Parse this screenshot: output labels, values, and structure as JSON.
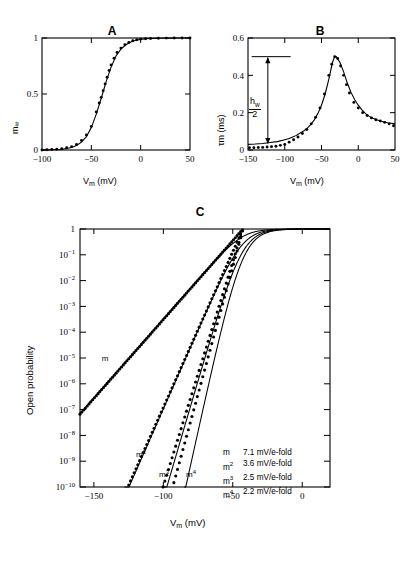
{
  "figure": {
    "panels": [
      {
        "id": "A",
        "letter": "A",
        "xlabel": "V",
        "xlabel_sub": "m",
        "xlabel_unit": " (mV)",
        "ylabel": "m",
        "ylabel_sub": "∞",
        "xticks": [
          -100,
          -50,
          0,
          50
        ],
        "xticklabels": [
          "−100",
          "−50",
          "0",
          "50"
        ],
        "yticks": [
          0,
          0.5,
          1
        ],
        "yticklabels": [
          "0",
          "0.5",
          "1"
        ],
        "xlim": [
          -100,
          50
        ],
        "ylim": [
          0,
          1
        ]
      },
      {
        "id": "B",
        "letter": "B",
        "xlabel": "V",
        "xlabel_sub": "m",
        "xlabel_unit": " (mV)",
        "ylabel": "τ",
        "ylabel_sub": "m",
        "ylabel_unit": " (ms)",
        "xticks": [
          -150,
          -100,
          -50,
          0,
          50
        ],
        "xticklabels": [
          "−150",
          "−100",
          "−50",
          "0",
          "50"
        ],
        "yticks": [
          0,
          0.2,
          0.4,
          0.6
        ],
        "yticklabels": [
          "0",
          "0.2",
          "0.4",
          "0.6"
        ],
        "xlim": [
          -150,
          50
        ],
        "ylim": [
          0,
          0.6
        ],
        "annotation": {
          "numerator": "h",
          "numerator_sub": "w",
          "denominator": "2",
          "arrow_top_value": 0.5,
          "arrow_bottom_value": 0.03
        }
      },
      {
        "id": "C",
        "letter": "C",
        "xlabel": "V",
        "xlabel_sub": "m",
        "xlabel_unit": " (mV)",
        "ylabel": "Open probability",
        "xticks": [
          -150,
          -100,
          -50,
          0
        ],
        "xticklabels": [
          "−150",
          "−100",
          "−50",
          "0"
        ],
        "yticklabels": [
          "1",
          "10⁻¹",
          "10⁻²",
          "10⁻³",
          "10⁻⁴",
          "10⁻⁵",
          "10⁻⁶",
          "10⁻⁷",
          "10⁻⁸",
          "10⁻⁹",
          "10⁻¹⁰"
        ],
        "yexponents": [
          0,
          -1,
          -2,
          -3,
          -4,
          -5,
          -6,
          -7,
          -8,
          -9,
          -10
        ],
        "xlim": [
          -160,
          20
        ],
        "ylim_exp": [
          -10,
          0
        ],
        "curve_tags": [
          "m",
          "m²",
          "m³",
          "m⁴"
        ],
        "legend": {
          "rows": [
            {
              "symbol": "m",
              "exponent": "",
              "value": "7.1 mV/e-fold"
            },
            {
              "symbol": "m",
              "exponent": "2",
              "value": "3.6 mV/e-fold"
            },
            {
              "symbol": "m",
              "exponent": "3",
              "value": "2.5 mV/e-fold"
            },
            {
              "symbol": "m",
              "exponent": "4",
              "value": "2.2 mV/e-fold"
            }
          ]
        }
      }
    ],
    "colors": {
      "ink": "#000000",
      "background": "#ffffff"
    }
  },
  "chart_data": [
    {
      "type": "line",
      "id": "A",
      "title": "A",
      "xlabel": "Vm (mV)",
      "ylabel": "m∞",
      "xlim": [
        -100,
        50
      ],
      "ylim": [
        0,
        1
      ],
      "grid": false,
      "legend": "none",
      "description": "Steady-state activation m-infinity versus membrane potential; sigmoid with half-activation near -38 mV; solid line is fit, filled circles are data.",
      "series": [
        {
          "name": "m_inf fit (solid line)",
          "style": "solid",
          "x": [
            -100,
            -95,
            -90,
            -85,
            -80,
            -75,
            -70,
            -65,
            -60,
            -55,
            -50,
            -45,
            -40,
            -35,
            -30,
            -25,
            -20,
            -15,
            -10,
            -5,
            0,
            5,
            10,
            15,
            20,
            25,
            30,
            35,
            40,
            45,
            50
          ],
          "y": [
            0.0,
            0.001,
            0.002,
            0.004,
            0.007,
            0.013,
            0.023,
            0.04,
            0.07,
            0.12,
            0.2,
            0.32,
            0.46,
            0.61,
            0.74,
            0.84,
            0.9,
            0.94,
            0.965,
            0.98,
            0.988,
            0.993,
            0.996,
            0.997,
            0.998,
            0.999,
            0.999,
            1.0,
            1.0,
            1.0,
            1.0
          ]
        },
        {
          "name": "data (filled circles)",
          "style": "dots",
          "x": [
            -100,
            -95,
            -90,
            -85,
            -80,
            -75,
            -70,
            -65,
            -60,
            -55,
            -50,
            -45,
            -42,
            -40,
            -38,
            -36,
            -34,
            -32,
            -30,
            -27,
            -24,
            -20,
            -16,
            -12,
            -8,
            -4,
            0,
            5,
            10,
            18,
            26,
            34,
            42,
            50
          ],
          "y": [
            0.0,
            0.002,
            0.004,
            0.007,
            0.012,
            0.02,
            0.03,
            0.05,
            0.085,
            0.135,
            0.21,
            0.34,
            0.42,
            0.47,
            0.53,
            0.59,
            0.65,
            0.71,
            0.76,
            0.82,
            0.87,
            0.91,
            0.94,
            0.96,
            0.975,
            0.985,
            0.99,
            0.993,
            0.996,
            0.998,
            0.999,
            1.0,
            1.0,
            1.0
          ]
        }
      ]
    },
    {
      "type": "line",
      "id": "B",
      "title": "B",
      "xlabel": "Vm (mV)",
      "ylabel": "τm (ms)",
      "xlim": [
        -150,
        50
      ],
      "ylim": [
        0,
        0.6
      ],
      "grid": false,
      "legend": "none",
      "annotation": "h_w/2 double-headed arrow from ~0.03 to 0.50 ms at x ≈ -123 mV; horizontal reference line at 0.50 ms from -143 to -92 mV",
      "description": "Activation time constant tau_m versus membrane potential; bell-shaped peak of 0.50 ms near -32 mV.",
      "series": [
        {
          "name": "tau_m fit (solid line)",
          "style": "solid",
          "x": [
            -150,
            -140,
            -130,
            -120,
            -110,
            -100,
            -95,
            -90,
            -85,
            -80,
            -75,
            -70,
            -65,
            -60,
            -55,
            -50,
            -45,
            -40,
            -35,
            -32,
            -30,
            -25,
            -20,
            -15,
            -10,
            -5,
            0,
            5,
            10,
            15,
            20,
            25,
            30,
            35,
            40,
            45,
            50
          ],
          "y": [
            0.03,
            0.032,
            0.035,
            0.04,
            0.045,
            0.055,
            0.06,
            0.068,
            0.077,
            0.088,
            0.1,
            0.115,
            0.135,
            0.16,
            0.195,
            0.24,
            0.3,
            0.38,
            0.47,
            0.5,
            0.5,
            0.47,
            0.42,
            0.36,
            0.31,
            0.27,
            0.24,
            0.215,
            0.195,
            0.18,
            0.17,
            0.162,
            0.155,
            0.15,
            0.146,
            0.143,
            0.14
          ]
        },
        {
          "name": "data (filled circles)",
          "style": "dots",
          "x": [
            -148,
            -142,
            -136,
            -130,
            -124,
            -118,
            -112,
            -106,
            -100,
            -94,
            -88,
            -82,
            -76,
            -70,
            -64,
            -58,
            -52,
            -46,
            -40,
            -36,
            -32,
            -28,
            -24,
            -20,
            -16,
            -12,
            -6,
            0,
            6,
            12,
            18,
            24,
            30,
            36,
            42,
            48
          ],
          "y": [
            0.012,
            0.012,
            0.013,
            0.014,
            0.016,
            0.018,
            0.02,
            0.025,
            0.03,
            0.042,
            0.055,
            0.07,
            0.088,
            0.11,
            0.14,
            0.175,
            0.225,
            0.3,
            0.4,
            0.46,
            0.5,
            0.49,
            0.45,
            0.4,
            0.35,
            0.305,
            0.255,
            0.225,
            0.2,
            0.185,
            0.172,
            0.162,
            0.155,
            0.148,
            0.14,
            0.13
          ]
        }
      ]
    },
    {
      "type": "line",
      "id": "C",
      "title": "C",
      "xlabel": "Vm (mV)",
      "ylabel": "Open probability",
      "xlim": [
        -160,
        20
      ],
      "ylim": [
        1e-10,
        1
      ],
      "yscale": "log",
      "grid": false,
      "legend_position": "inside-right-lower",
      "description": "Open probability on a log axis for m, m^2, m^3 and m^4, each shown as a solid exact curve and a dotted limiting exponential; slope factors are 7.1, 3.6, 2.5 and 2.2 mV per e-fold respectively.",
      "series": [
        {
          "name": "m (solid)",
          "power": 1,
          "style": "solid",
          "slope_mV_per_efold": 7.1
        },
        {
          "name": "m (dotted limit)",
          "power": 1,
          "style": "dotted",
          "slope_mV_per_efold": 7.1
        },
        {
          "name": "m^2 (solid)",
          "power": 2,
          "style": "solid",
          "slope_mV_per_efold": 3.6
        },
        {
          "name": "m^2 (dotted limit)",
          "power": 2,
          "style": "dotted",
          "slope_mV_per_efold": 3.6
        },
        {
          "name": "m^3 (solid)",
          "power": 3,
          "style": "solid",
          "slope_mV_per_efold": 2.5
        },
        {
          "name": "m^3 (dotted limit)",
          "power": 3,
          "style": "dotted",
          "slope_mV_per_efold": 2.5
        },
        {
          "name": "m^4 (solid)",
          "power": 4,
          "style": "solid",
          "slope_mV_per_efold": 2.2
        },
        {
          "name": "m^4 (dotted limit)",
          "power": 4,
          "style": "dotted",
          "slope_mV_per_efold": 2.2
        }
      ]
    }
  ]
}
